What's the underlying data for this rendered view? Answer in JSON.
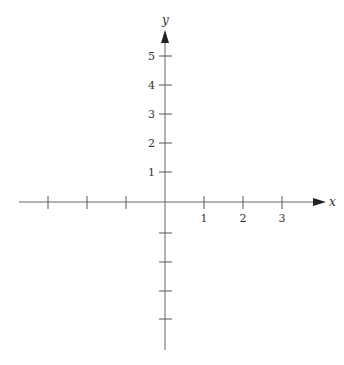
{
  "diagram": {
    "type": "coordinate-plane",
    "x_axis": {
      "label": "x",
      "tick_labels": [
        "1",
        "2",
        "3"
      ],
      "tick_values": [
        -3,
        -2,
        -1,
        1,
        2,
        3
      ],
      "range": [
        -3.8,
        4.2
      ]
    },
    "y_axis": {
      "label": "y",
      "tick_labels": [
        "1",
        "2",
        "3",
        "4",
        "5"
      ],
      "tick_values": [
        -5,
        -4,
        -3,
        -2,
        -1,
        1,
        2,
        3,
        4,
        5
      ],
      "range": [
        -5.1,
        5.9
      ]
    },
    "colors": {
      "axis": "#555555",
      "text": "#333333",
      "background": "#ffffff"
    }
  }
}
